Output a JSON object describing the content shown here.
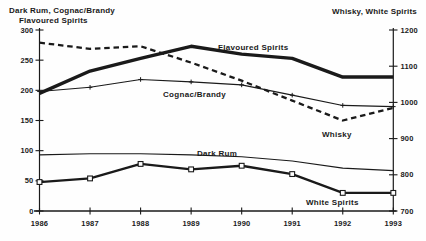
{
  "titles": {
    "left_axis_line1": "Dark Rum, Cognac/Brandy",
    "left_axis_line2": "Flavoured Spirits",
    "right_axis": "Whisky, White Spirits"
  },
  "colors": {
    "ink": "#1a1a1a",
    "background": "#fefefe"
  },
  "chart_data": {
    "type": "line",
    "title": "",
    "x": [
      1986,
      1987,
      1988,
      1989,
      1990,
      1991,
      1992,
      1993
    ],
    "x_tick_labels": [
      "1986",
      "1987",
      "1988",
      "1989",
      "1990",
      "1991",
      "1992",
      "1993"
    ],
    "left_axis": {
      "label": "Dark Rum, Cognac/Brandy Flavoured Spirits",
      "range": [
        0,
        300
      ],
      "ticks": [
        0,
        50,
        100,
        150,
        200,
        250,
        300
      ]
    },
    "right_axis": {
      "label": "Whisky, White Spirits",
      "range": [
        700,
        1200
      ],
      "ticks": [
        700,
        800,
        900,
        1000,
        1100,
        1200
      ]
    },
    "grid": false,
    "legend": "inline-labels",
    "series": [
      {
        "name": "Flavoured Spirits",
        "axis": "left",
        "style": "thick-solid",
        "marker": "none",
        "values": [
          195,
          232,
          253,
          273,
          260,
          253,
          222,
          222
        ],
        "label_x": 218,
        "label_y": 50
      },
      {
        "name": "Cognac/Brandy",
        "axis": "left",
        "style": "thin-solid",
        "marker": "plus",
        "values": [
          198,
          205,
          218,
          214,
          209,
          192,
          175,
          173
        ],
        "label_x": 163,
        "label_y": 97
      },
      {
        "name": "Whisky",
        "axis": "right",
        "style": "dashed",
        "marker": "none",
        "values": [
          1165,
          1148,
          1155,
          1110,
          1060,
          1005,
          950,
          985
        ],
        "label_x": 322,
        "label_y": 137
      },
      {
        "name": "Dark Rum",
        "axis": "left",
        "style": "thin-solid",
        "marker": "none",
        "values": [
          93,
          95,
          95,
          93,
          90,
          83,
          71,
          67
        ],
        "label_x": 197,
        "label_y": 156
      },
      {
        "name": "White Spirits",
        "axis": "right",
        "style": "medium-solid",
        "marker": "open-square",
        "values": [
          780,
          790,
          830,
          815,
          825,
          802,
          750,
          750
        ],
        "label_x": 306,
        "label_y": 205
      }
    ]
  }
}
